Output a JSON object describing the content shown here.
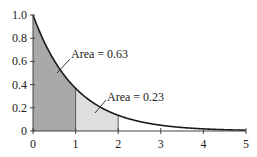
{
  "chart_data": {
    "type": "area",
    "title": "",
    "xlabel": "",
    "ylabel": "",
    "function": "exp(-x)",
    "xlim": [
      0,
      5
    ],
    "ylim": [
      0,
      1.0
    ],
    "x_ticks": [
      0,
      1,
      2,
      3,
      4,
      5
    ],
    "x_tick_labels": [
      "0",
      "1",
      "2",
      "3",
      "4",
      "5"
    ],
    "y_ticks": [
      0,
      0.2,
      0.4,
      0.6,
      0.8,
      1.0
    ],
    "y_tick_labels": [
      "0",
      "0.2",
      "0.4",
      "0.6",
      "0.8",
      "1.0"
    ],
    "grid": false,
    "series": [
      {
        "name": "curve",
        "x": [
          0,
          0.25,
          0.5,
          0.75,
          1,
          1.5,
          2,
          2.5,
          3,
          3.5,
          4,
          4.5,
          5
        ],
        "y": [
          1.0,
          0.78,
          0.61,
          0.47,
          0.37,
          0.22,
          0.14,
          0.08,
          0.05,
          0.03,
          0.02,
          0.01,
          0.01
        ]
      }
    ],
    "shaded_regions": [
      {
        "from": 0,
        "to": 1,
        "color": "#a9a9a9",
        "label": "Area = 0.63"
      },
      {
        "from": 1,
        "to": 2,
        "color": "#dedede",
        "label": "Area = 0.23"
      }
    ],
    "annotations": [
      {
        "text": "Area = 0.63",
        "text_pos": [
          71,
          58
        ],
        "line": [
          [
            70,
            59
          ],
          [
            57,
            73
          ]
        ]
      },
      {
        "text": "Area = 0.23",
        "text_pos": [
          107,
          101
        ],
        "line": [
          [
            106,
            100
          ],
          [
            95,
            113
          ]
        ]
      }
    ]
  },
  "layout": {
    "x0": 33,
    "xscale": 42.6,
    "y0": 131,
    "yscale": 116
  }
}
